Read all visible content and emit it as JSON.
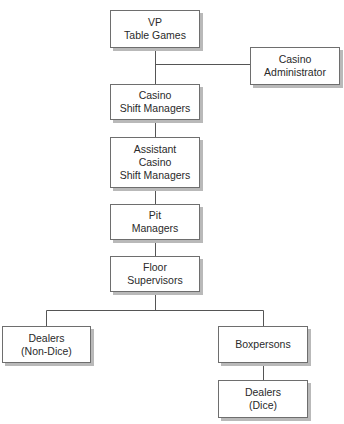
{
  "diagram": {
    "type": "org-chart",
    "nodes": {
      "vp": {
        "lines": [
          "VP",
          "Table Games"
        ]
      },
      "casino_admin": {
        "lines": [
          "Casino",
          "Administrator"
        ]
      },
      "casino_shift": {
        "lines": [
          "Casino",
          "Shift Managers"
        ]
      },
      "assistant_shift": {
        "lines": [
          "Assistant",
          "Casino",
          "Shift Managers"
        ]
      },
      "pit": {
        "lines": [
          "Pit",
          "Managers"
        ]
      },
      "floor": {
        "lines": [
          "Floor",
          "Supervisors"
        ]
      },
      "dealers_non_dice": {
        "lines": [
          "Dealers",
          "(Non-Dice)"
        ]
      },
      "boxpersons": {
        "lines": [
          "Boxpersons"
        ]
      },
      "dealers_dice": {
        "lines": [
          "Dealers",
          "(Dice)"
        ]
      }
    },
    "edges": [
      [
        "vp",
        "casino_admin"
      ],
      [
        "vp",
        "casino_shift"
      ],
      [
        "casino_shift",
        "assistant_shift"
      ],
      [
        "assistant_shift",
        "pit"
      ],
      [
        "pit",
        "floor"
      ],
      [
        "floor",
        "dealers_non_dice"
      ],
      [
        "floor",
        "boxpersons"
      ],
      [
        "boxpersons",
        "dealers_dice"
      ]
    ],
    "colors": {
      "line": "#555555",
      "border": "#6e6e6e",
      "shadow": "#b9b9b9"
    }
  }
}
